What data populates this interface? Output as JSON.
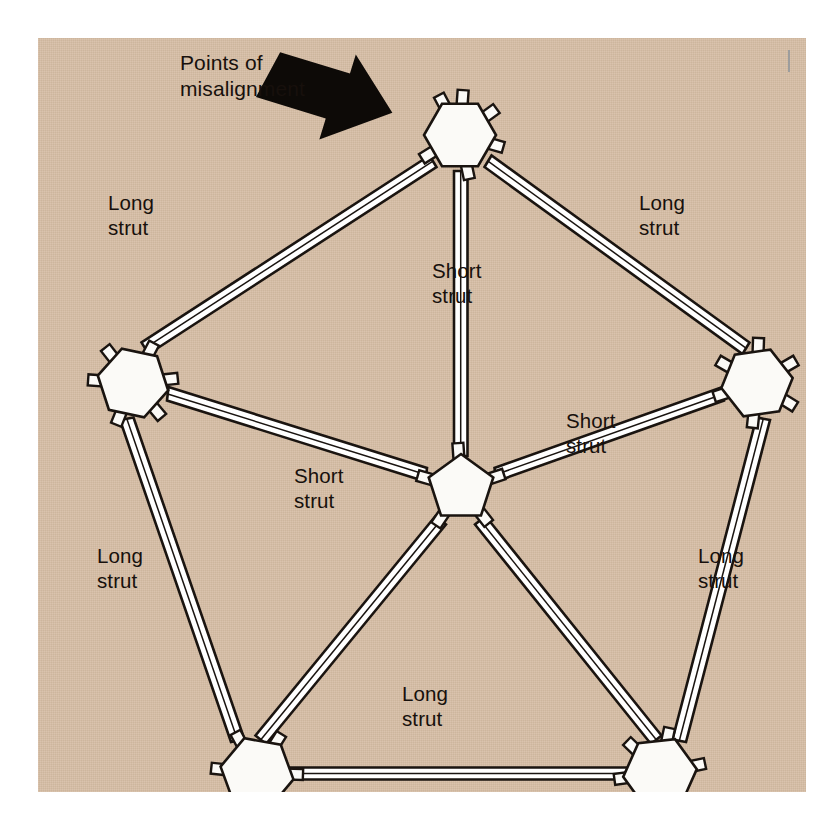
{
  "figure": {
    "panel_color": "#d6bda4",
    "strut_fill": "#ffffff",
    "strut_outline": "#1a1410",
    "node_fill": "#fbfaf7",
    "node_outline": "#1a1410",
    "arrow_color": "#0d0a07",
    "text_color": "#17100c"
  },
  "callout": {
    "line1": "Points of",
    "line2": "misalignment",
    "arrow_icon": "thick-right-arrow"
  },
  "labels": [
    {
      "id": "long-strut-upper-left",
      "line1": "Long",
      "line2": "strut",
      "x": 110,
      "y": 190
    },
    {
      "id": "long-strut-upper-right",
      "line1": "Long",
      "line2": "strut",
      "x": 641,
      "y": 190
    },
    {
      "id": "short-strut-top-center",
      "line1": "Short",
      "line2": "strut",
      "x": 434,
      "y": 258
    },
    {
      "id": "short-strut-right",
      "line1": "Short",
      "line2": "strut",
      "x": 568,
      "y": 408
    },
    {
      "id": "short-strut-left",
      "line1": "Short",
      "line2": "strut",
      "x": 296,
      "y": 463
    },
    {
      "id": "long-strut-lower-left",
      "line1": "Long",
      "line2": "strut",
      "x": 99,
      "y": 543
    },
    {
      "id": "long-strut-lower-right",
      "line1": "Long",
      "line2": "strut",
      "x": 700,
      "y": 543
    },
    {
      "id": "long-strut-bottom",
      "line1": "Long",
      "line2": "strut",
      "x": 404,
      "y": 681
    }
  ],
  "nodes": [
    {
      "id": "node-top",
      "shape": "hexagon",
      "cx": 422,
      "cy": 97,
      "r": 36,
      "rot": 0,
      "stubs": 6
    },
    {
      "id": "node-left",
      "shape": "hexagon",
      "cx": 95,
      "cy": 345,
      "r": 36,
      "rot": 12,
      "stubs": 6
    },
    {
      "id": "node-right",
      "shape": "hexagon",
      "cx": 719,
      "cy": 345,
      "r": 36,
      "rot": -8,
      "stubs": 6
    },
    {
      "id": "node-center",
      "shape": "pentagon",
      "cx": 423,
      "cy": 450,
      "r": 38,
      "rot": 0,
      "stubs": 5
    },
    {
      "id": "node-bottom-left",
      "shape": "hexagon",
      "cx": 219,
      "cy": 735,
      "r": 37,
      "rot": 10,
      "stubs": 6
    },
    {
      "id": "node-bottom-right",
      "shape": "hexagon",
      "cx": 622,
      "cy": 735,
      "r": 37,
      "rot": -6,
      "stubs": 6
    }
  ],
  "struts": [
    {
      "id": "strut-top-to-left",
      "type": "long",
      "from": "node-top",
      "to": "node-left"
    },
    {
      "id": "strut-top-to-right",
      "type": "long",
      "from": "node-top",
      "to": "node-right"
    },
    {
      "id": "strut-top-to-center",
      "type": "short",
      "from": "node-top",
      "to": "node-center"
    },
    {
      "id": "strut-left-to-center",
      "type": "short",
      "from": "node-left",
      "to": "node-center"
    },
    {
      "id": "strut-right-to-center",
      "type": "short",
      "from": "node-right",
      "to": "node-center"
    },
    {
      "id": "strut-center-to-bottom-left",
      "type": "short",
      "from": "node-center",
      "to": "node-bottom-left"
    },
    {
      "id": "strut-center-to-bottom-right",
      "type": "short",
      "from": "node-center",
      "to": "node-bottom-right"
    },
    {
      "id": "strut-left-to-bottom-left",
      "type": "long",
      "from": "node-left",
      "to": "node-bottom-left"
    },
    {
      "id": "strut-right-to-bottom-right",
      "type": "long",
      "from": "node-right",
      "to": "node-bottom-right"
    },
    {
      "id": "strut-bottom",
      "type": "long",
      "from": "node-bottom-left",
      "to": "node-bottom-right"
    }
  ]
}
